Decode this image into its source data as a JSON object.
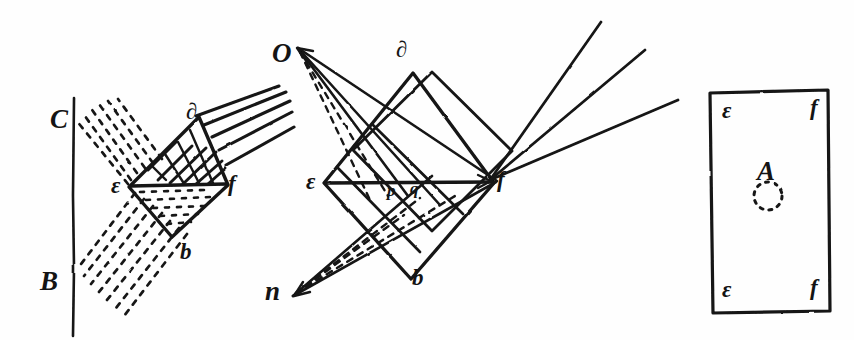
{
  "image": {
    "kind": "hand-drawn-manuscript-diagram",
    "subject": "optics-refraction-prism-figures",
    "width": 854,
    "height": 340,
    "ink_color": "#141414",
    "paper_color": "#fefefe"
  },
  "figures": [
    {
      "id": "figure-left",
      "name": "left-prism-figure",
      "description": "Rhombus prism struck by parallel rays from upper right; dashed ray bundles diverge to a vertical screen line at left marked C and B",
      "labels": [
        {
          "key": "C",
          "text": "C",
          "x": 50,
          "y": 106,
          "size": "lbl-lg"
        },
        {
          "key": "B",
          "text": "B",
          "x": 40,
          "y": 268,
          "size": "lbl-lg"
        },
        {
          "key": "d",
          "text": "∂",
          "x": 186,
          "y": 100,
          "size": "lbl-md"
        },
        {
          "key": "epsilon",
          "text": "ε",
          "x": 111,
          "y": 174,
          "size": "lbl-md"
        },
        {
          "key": "f",
          "text": "f",
          "x": 228,
          "y": 172,
          "size": "lbl-md"
        },
        {
          "key": "b",
          "text": "b",
          "x": 180,
          "y": 240,
          "size": "lbl-md"
        }
      ]
    },
    {
      "id": "figure-middle",
      "name": "middle-prism-figure",
      "description": "Rhombus prism with rays converging from point O above-left and point n below-left, crossing at p and q on the axis, exiting as three rays toward upper right past f",
      "labels": [
        {
          "key": "O",
          "text": "O",
          "x": 272,
          "y": 40,
          "size": "lbl-lg"
        },
        {
          "key": "d",
          "text": "∂",
          "x": 396,
          "y": 38,
          "size": "lbl-md"
        },
        {
          "key": "epsilon",
          "text": "ε",
          "x": 306,
          "y": 170,
          "size": "lbl-md"
        },
        {
          "key": "p",
          "text": "p",
          "x": 387,
          "y": 182,
          "size": "lbl-sm"
        },
        {
          "key": "q",
          "text": "q",
          "x": 410,
          "y": 180,
          "size": "lbl-sm"
        },
        {
          "key": "f",
          "text": "f",
          "x": 497,
          "y": 168,
          "size": "lbl-md"
        },
        {
          "key": "n",
          "text": "n",
          "x": 265,
          "y": 278,
          "size": "lbl-lg"
        },
        {
          "key": "b",
          "text": "b",
          "x": 412,
          "y": 266,
          "size": "lbl-md"
        }
      ]
    },
    {
      "id": "figure-right",
      "name": "right-screen-figure",
      "description": "Upright rectangle representing a screen or card, corners marked epsilon and f, with a script A above a small dotted circle at the centre",
      "labels": [
        {
          "key": "epsilon-top",
          "text": "ε",
          "x": 722,
          "y": 99,
          "size": "lbl-md"
        },
        {
          "key": "f-top",
          "text": "f",
          "x": 810,
          "y": 96,
          "size": "lbl-md"
        },
        {
          "key": "A",
          "text": "A",
          "x": 757,
          "y": 158,
          "size": "lbl-lg"
        },
        {
          "key": "epsilon-bottom",
          "text": "ε",
          "x": 722,
          "y": 278,
          "size": "lbl-md"
        },
        {
          "key": "f-bottom",
          "text": "f",
          "x": 810,
          "y": 276,
          "size": "lbl-md"
        }
      ]
    }
  ],
  "annotations": {
    "left_figure_rays": "five parallel incident rays from upper right",
    "left_figure_dashed_fans": "two dashed ray fans spreading leftward to the screen line",
    "middle_figure_rays": "three emergent rays toward upper right",
    "right_figure_marker": "dotted circle beneath script A"
  }
}
